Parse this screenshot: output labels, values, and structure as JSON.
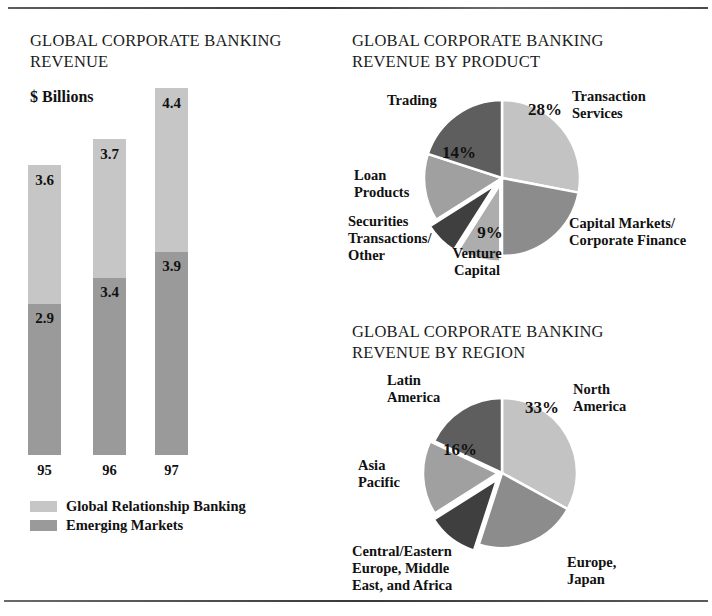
{
  "document": {
    "rules": [
      "top-rule",
      "bottom-rule"
    ]
  },
  "bar_chart": {
    "title": "GLOBAL CORPORATE BANKING REVENUE",
    "subtitle": "$ Billions",
    "legend": [
      {
        "label": "Global Relationship Banking",
        "color": "#c6c6c6"
      },
      {
        "label": "Emerging Markets",
        "color": "#9a9a9a"
      }
    ]
  },
  "pie_product": {
    "title": "GLOBAL CORPORATE BANKING REVENUE BY PRODUCT",
    "labels": {
      "transaction_services": "Transaction\nServices",
      "transaction_services_l1": "Transaction",
      "transaction_services_l2": "Services",
      "capital_markets_l1": "Capital Markets/",
      "capital_markets_l2": "Corporate Finance",
      "venture_capital_l1": "Venture",
      "venture_capital_l2": "Capital",
      "securities_l1": "Securities",
      "securities_l2": "Transactions/",
      "securities_l3": "Other",
      "loan_products_l1": "Loan",
      "loan_products_l2": "Products",
      "trading": "Trading"
    }
  },
  "pie_region": {
    "title": "GLOBAL CORPORATE BANKING REVENUE BY REGION",
    "labels": {
      "north_america_l1": "North",
      "north_america_l2": "America",
      "europe_japan_l1": "Europe,",
      "europe_japan_l2": "Japan",
      "ceemea_l1": "Central/Eastern",
      "ceemea_l2": "Europe, Middle",
      "ceemea_l3": "East, and Africa",
      "asia_pacific_l1": "Asia",
      "asia_pacific_l2": "Pacific",
      "latin_america_l1": "Latin",
      "latin_america_l2": "America"
    }
  },
  "chart_data": [
    {
      "type": "bar",
      "subtype": "stacked-column",
      "title": "GLOBAL CORPORATE BANKING REVENUE",
      "xlabel": "",
      "ylabel": "$ Billions",
      "ylim": [
        0,
        8.3
      ],
      "grid": false,
      "legend_position": "bottom-left",
      "categories": [
        "95",
        "96",
        "97"
      ],
      "series": [
        {
          "name": "Global Relationship Banking",
          "color": "#c6c6c6",
          "values": [
            3.6,
            3.7,
            4.4
          ]
        },
        {
          "name": "Emerging Markets",
          "color": "#9a9a9a",
          "values": [
            2.9,
            3.4,
            3.9
          ]
        }
      ],
      "totals": [
        6.5,
        7.1,
        8.3
      ],
      "data_labels": [
        {
          "category": "95",
          "top": "3.6",
          "bottom": "2.9"
        },
        {
          "category": "96",
          "top": "3.7",
          "bottom": "3.4"
        },
        {
          "category": "97",
          "top": "4.4",
          "bottom": "3.9"
        }
      ]
    },
    {
      "type": "pie",
      "title": "GLOBAL CORPORATE BANKING REVENUE BY PRODUCT",
      "legend_position": "callout-labels",
      "start_angle_deg": 0,
      "slices": [
        {
          "label": "Transaction Services",
          "value": 28,
          "display": "28%",
          "color": "#c3c3c3",
          "label_pos": "right-top"
        },
        {
          "label": "Capital Markets/Corporate Finance",
          "value": 22,
          "display": "",
          "color": "#8c8c8c",
          "label_pos": "right-bottom"
        },
        {
          "label": "Venture Capital",
          "value": 9,
          "display": "9%",
          "color": "#adadad",
          "label_pos": "bottom"
        },
        {
          "label": "Securities Transactions/Other",
          "value": 7,
          "display": "",
          "color": "#3f3f3f",
          "label_pos": "left-bottom"
        },
        {
          "label": "Loan Products",
          "value": 14,
          "display": "14%",
          "color": "#a0a0a0",
          "label_pos": "left"
        },
        {
          "label": "Trading",
          "value": 20,
          "display": "",
          "color": "#5e5e5e",
          "label_pos": "left-top"
        }
      ]
    },
    {
      "type": "pie",
      "title": "GLOBAL CORPORATE BANKING REVENUE BY REGION",
      "legend_position": "callout-labels",
      "start_angle_deg": 0,
      "slices": [
        {
          "label": "North America",
          "value": 33,
          "display": "33%",
          "color": "#c3c3c3",
          "label_pos": "right-top"
        },
        {
          "label": "Europe, Japan",
          "value": 22,
          "display": "",
          "color": "#8c8c8c",
          "label_pos": "right-bottom"
        },
        {
          "label": "Central/Eastern Europe, Middle East, and Africa",
          "value": 11,
          "display": "",
          "color": "#3f3f3f",
          "label_pos": "bottom-left"
        },
        {
          "label": "Asia Pacific",
          "value": 16,
          "display": "16%",
          "color": "#a0a0a0",
          "label_pos": "left"
        },
        {
          "label": "Latin America",
          "value": 18,
          "display": "",
          "color": "#5e5e5e",
          "label_pos": "left-top"
        }
      ]
    }
  ]
}
